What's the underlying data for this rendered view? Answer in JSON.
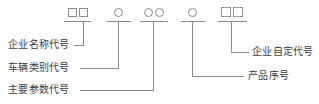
{
  "diagram": {
    "stroke_color": "#8b8b8b",
    "text_color": "#3d3d3d",
    "background": "#ffffff",
    "symbol_groups": [
      {
        "id": "enterprise-name-symbols",
        "kind": "square",
        "count": 2,
        "glyph": "□□",
        "label_ref": "enterprise-name-code"
      },
      {
        "id": "vehicle-category-symbols",
        "kind": "circle",
        "count": 1,
        "glyph": "○",
        "label_ref": "vehicle-category-code"
      },
      {
        "id": "main-parameter-symbols",
        "kind": "circle",
        "count": 2,
        "glyph": "○○",
        "label_ref": "main-parameter-code"
      },
      {
        "id": "product-serial-symbols",
        "kind": "circle",
        "count": 1,
        "glyph": "○",
        "label_ref": "product-serial-number"
      },
      {
        "id": "enterprise-custom-symbols",
        "kind": "square-dashed",
        "count": 2,
        "glyph": "□□",
        "label_ref": "enterprise-custom-code"
      }
    ],
    "labels": {
      "enterprise_name_code": "企业名称代号",
      "vehicle_category_code": "车辆类别代号",
      "main_parameter_code": "主要参数代号",
      "enterprise_custom_code": "企业自定代号",
      "product_serial_number": "产品序号"
    }
  }
}
